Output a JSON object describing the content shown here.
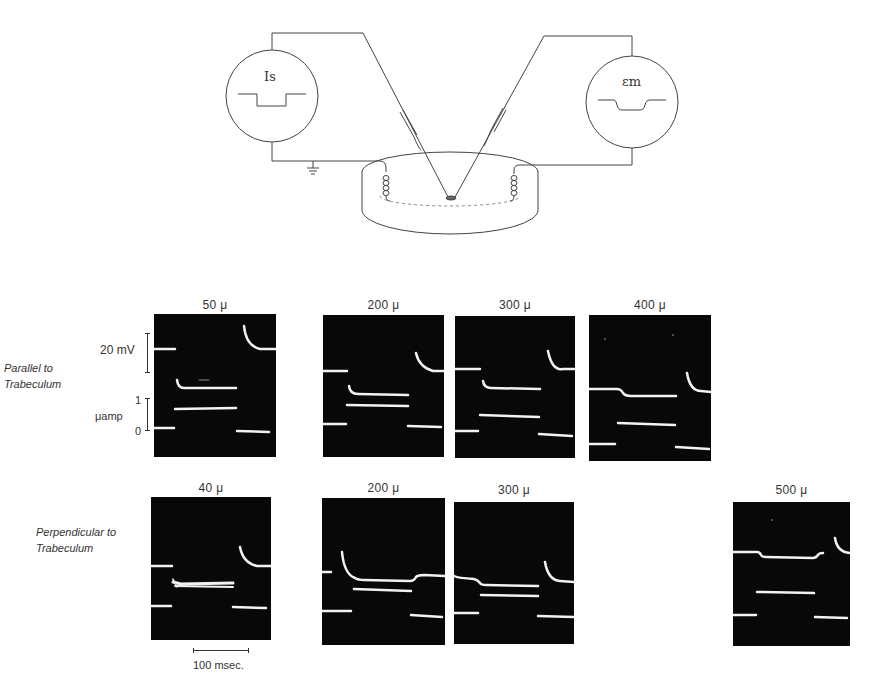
{
  "diagram": {
    "stimulator_label": "Is",
    "recorder_label": "εm"
  },
  "rows": [
    {
      "label": "Parallel to\nTrabeculum",
      "panels": [
        {
          "distance": "50 μ"
        },
        {
          "distance": "200 μ"
        },
        {
          "distance": "300 μ"
        },
        {
          "distance": "400 μ"
        }
      ]
    },
    {
      "label": "Perpendicular to\nTrabeculum",
      "panels": [
        {
          "distance": "40 μ"
        },
        {
          "distance": "200 μ"
        },
        {
          "distance": "300 μ"
        },
        {
          "distance": "500 μ"
        }
      ]
    }
  ],
  "calibration": {
    "voltage_label": "20 mV",
    "current_top": "1",
    "current_unit": "μamp",
    "current_zero": "0"
  },
  "time_scale": {
    "label": "100 msec."
  }
}
